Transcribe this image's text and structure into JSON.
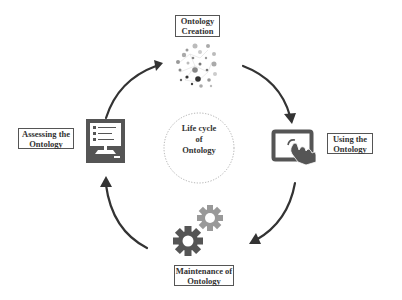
{
  "diagram": {
    "center": {
      "lines": [
        "Life cycle",
        "of",
        "Ontology"
      ]
    },
    "stages": [
      {
        "id": "creation",
        "lines": [
          "Ontology",
          "Creation"
        ],
        "icon": "network-dots-icon"
      },
      {
        "id": "using",
        "lines": [
          "Using the",
          "Ontology"
        ],
        "icon": "touch-screen-icon"
      },
      {
        "id": "maintenance",
        "lines": [
          "Maintenance of",
          "Ontology"
        ],
        "icon": "gears-icon"
      },
      {
        "id": "assessing",
        "lines": [
          "Assessing the",
          "Ontology"
        ],
        "icon": "monitor-checklist-icon"
      }
    ],
    "flow": [
      "creation",
      "using",
      "maintenance",
      "assessing",
      "creation"
    ],
    "colors": {
      "icon_dark": "#555555",
      "icon_light": "#999999",
      "arrow": "#333333",
      "border": "#555555"
    }
  }
}
